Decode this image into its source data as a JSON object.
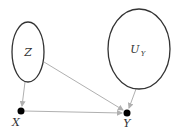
{
  "diagram": {
    "type": "causal-graph",
    "nodes": [
      {
        "id": "Z",
        "label": "Z",
        "shape": "ellipse",
        "cx": 28,
        "cy": 52,
        "rx": 16,
        "ry": 30
      },
      {
        "id": "U_Y",
        "label": "U",
        "subscript": "Y",
        "shape": "ellipse",
        "cx": 139,
        "cy": 49,
        "rx": 31,
        "ry": 40
      },
      {
        "id": "X",
        "label": "X",
        "shape": "point",
        "cx": 21,
        "cy": 111
      },
      {
        "id": "Y",
        "label": "Y",
        "shape": "point",
        "cx": 127,
        "cy": 113
      }
    ],
    "edges": [
      {
        "from": "Z",
        "to": "X"
      },
      {
        "from": "Z",
        "to": "Y"
      },
      {
        "from": "X",
        "to": "Y"
      },
      {
        "from": "U_Y",
        "to": "Y"
      }
    ],
    "colors": {
      "ellipse_stroke": "#333333",
      "edge": "#b0b0b0",
      "point": "#000000",
      "label": "#333333"
    }
  }
}
